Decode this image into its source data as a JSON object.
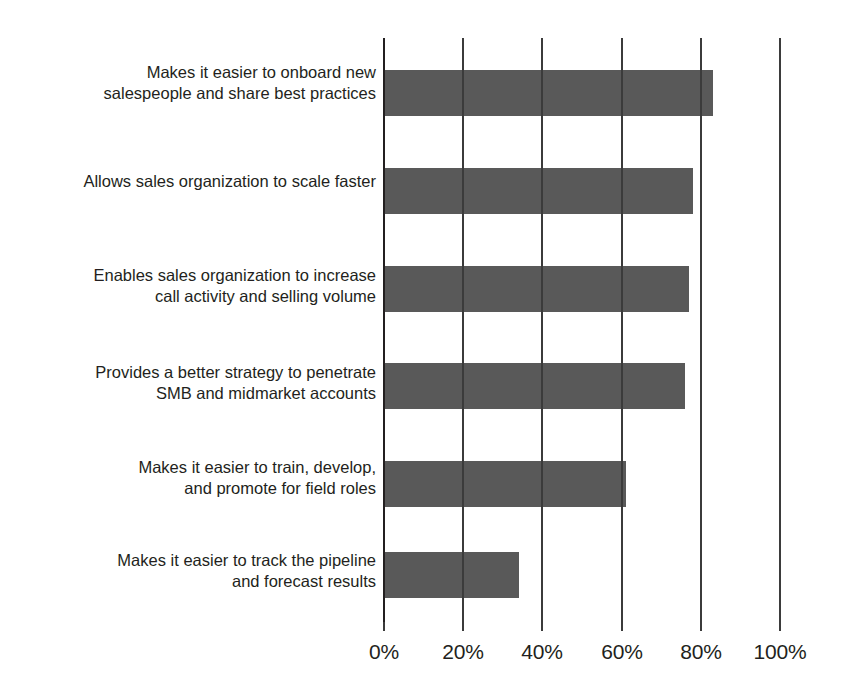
{
  "chart_data": {
    "type": "bar",
    "orientation": "horizontal",
    "title": "",
    "subtitle": "",
    "xlabel": "",
    "ylabel": "",
    "xlim": [
      0,
      100
    ],
    "xticks": [
      0,
      20,
      40,
      60,
      80,
      100
    ],
    "xtick_labels": [
      "0%",
      "20%",
      "40%",
      "60%",
      "80%",
      "100%"
    ],
    "grid": true,
    "legend": null,
    "bar_color": "#595959",
    "axis_color": "#231f20",
    "categories": [
      "Makes it easier to onboard new\nsalespeople and share best practices",
      "Allows sales organization to scale faster",
      "Enables sales organization to increase\ncall activity and selling volume",
      "Provides a better strategy to penetrate\nSMB and midmarket accounts",
      "Makes it easier to train, develop,\nand promote for field roles",
      "Makes it easier to track the pipeline\nand forecast results"
    ],
    "values": [
      83,
      78,
      77,
      76,
      61,
      34
    ],
    "series": [
      {
        "name": "",
        "values": [
          83,
          78,
          77,
          76,
          61,
          34
        ]
      }
    ]
  }
}
